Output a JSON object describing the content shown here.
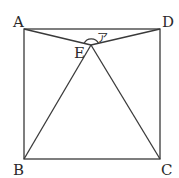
{
  "diagram": {
    "type": "geometry",
    "points": {
      "A": {
        "label": "A",
        "x": 24,
        "y": 29
      },
      "D": {
        "label": "D",
        "x": 160,
        "y": 29
      },
      "B": {
        "label": "B",
        "x": 24,
        "y": 159
      },
      "C": {
        "label": "C",
        "x": 160,
        "y": 159
      },
      "E": {
        "label": "E",
        "x": 91,
        "y": 45
      }
    },
    "angle_mark": {
      "label": "ア",
      "vertex": "E",
      "between": [
        "A",
        "D"
      ]
    },
    "colors": {
      "stroke": "#3a3a3a",
      "background": "#ffffff"
    }
  }
}
